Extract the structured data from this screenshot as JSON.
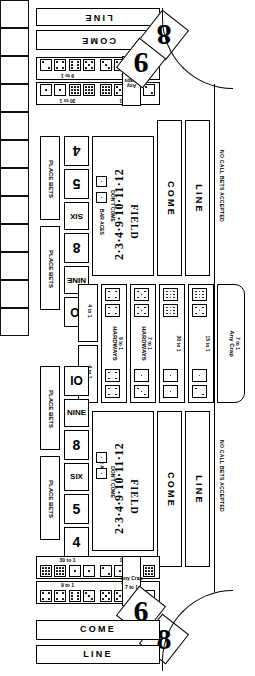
{
  "table": {
    "name": "craps-table-layout",
    "orientation": "two-sided mirrored craps layout"
  },
  "top_side": {
    "line_label": "LINE",
    "come_label": "COME",
    "place_bets_label": "PLACE BETS",
    "place_numbers_left": [
      "4",
      "5",
      "SIX"
    ],
    "place_numbers_right": [
      "8",
      "NINE",
      "IO"
    ],
    "bar_aces_label": "BAR ACES",
    "dont_come_label": "DON'T COME",
    "field_label": "FIELD",
    "field_numbers": "2·3·4·9·10·11·12",
    "come_box_label": "COME",
    "line_box_label": "LINE",
    "no_call_label": "NO CALL BETS ACCEPTED",
    "corner_numbers": [
      "8",
      "9"
    ],
    "prop_rows": [
      {
        "odds": "9 to 1"
      },
      {
        "odds": "7 to 1"
      },
      {
        "odds": "30 to 1"
      },
      {
        "odds": "15 to 1"
      }
    ],
    "any_craps_label": "Any Craps",
    "any_craps_odds": "7 to 1"
  },
  "bottom_side": {
    "line_label": "LINE",
    "come_label": "COME",
    "place_bets_label": "PLACE BETS",
    "place_numbers_left": [
      "IO",
      "NINE",
      "8"
    ],
    "place_numbers_right": [
      "SIX",
      "5",
      "4"
    ],
    "bar_aces_label": "BAR ACES",
    "dont_come_label": "DON'T COME",
    "field_label": "FIELD",
    "field_numbers": "2·3·4·9·10·11·12",
    "come_box_label": "COME",
    "line_box_label": "LINE",
    "no_call_label": "NO CALL BETS ACCEPTED",
    "corner_numbers": [
      "6",
      "8"
    ],
    "prop_rows": [
      {
        "odds": "30 to 1"
      },
      {
        "odds": "15 to 1"
      },
      {
        "odds": "9 to 1"
      },
      {
        "odds": "7 to 1"
      }
    ],
    "any_craps_label": "Any Crap",
    "any_craps_odds": "7 to 1"
  },
  "center": {
    "hardways_left_label": "HARDWAYS",
    "hardways_left_odds": "9 to 1",
    "hardways_right_label": "HARDWAYS",
    "hardways_right_odds": "7 to 1",
    "thirty_label": "30 to 1",
    "fifteen_label": "15 to 1",
    "any_crap_label": "Any Crap",
    "any_crap_odds": "7 to 1",
    "ce_top_odds": "4 to 1",
    "ce_bottom_odds": "4 to 1"
  },
  "colors": {
    "ink": "#000000",
    "felt": "#ffffff"
  }
}
